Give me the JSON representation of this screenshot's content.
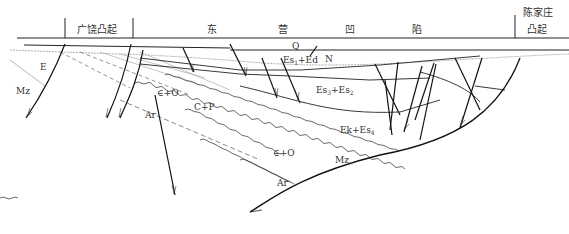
{
  "header": {
    "regions": [
      {
        "id": "guangrao",
        "label": "广饶凸起"
      },
      {
        "id": "dong",
        "label": "东"
      },
      {
        "id": "ying",
        "label": "营"
      },
      {
        "id": "ao",
        "label": "凹"
      },
      {
        "id": "xian",
        "label": "陷"
      },
      {
        "id": "chenjiazhuang_1",
        "label": "陈家庄"
      },
      {
        "id": "chenjiazhuang_2",
        "label": "凸起"
      }
    ]
  },
  "strata": {
    "Q": "Q",
    "N": "N",
    "E": "E",
    "Mz_left": "Mz",
    "Es1Ed": {
      "a": "Es",
      "a_sub": "1",
      "b": "+Ed"
    },
    "Es3Es2": {
      "a": "Es",
      "a_sub": "3",
      "b": "+Es",
      "b_sub": "2"
    },
    "EkEs4": {
      "a": "Ek+Es",
      "a_sub": "4"
    },
    "CO_upper": "∈+O",
    "CP": "C+P",
    "Ar_upper": "Ar",
    "CO_lower": "∈+O",
    "Mz_right": "Mz",
    "Ar_lower": "Ar"
  },
  "colors": {
    "line": "#1a1a1a",
    "dashed": "#555555",
    "unconformity": "#777777"
  }
}
